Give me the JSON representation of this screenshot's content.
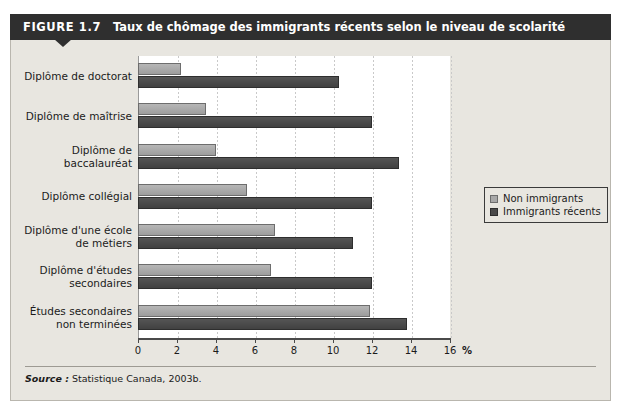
{
  "figure": {
    "number": "FIGURE 1.7",
    "title": "Taux de chômage des immigrants récents selon le niveau de scolarité",
    "source_label": "Source :",
    "source_text": " Statistique Canada, 2003b."
  },
  "legend": {
    "items": [
      {
        "label": "Non immigrants",
        "color": "#a8a8a8"
      },
      {
        "label": "Immigrants récents",
        "color": "#4a4a4a"
      }
    ]
  },
  "axis": {
    "unit": "%",
    "ticks": [
      "0",
      "2",
      "4",
      "6",
      "8",
      "10",
      "12",
      "14",
      "16"
    ]
  },
  "chart_data": {
    "type": "bar",
    "orientation": "horizontal",
    "title": "Taux de chômage des immigrants récents selon le niveau de scolarité",
    "xlabel": "%",
    "ylabel": "",
    "xlim": [
      0,
      16
    ],
    "xticks": [
      0,
      2,
      4,
      6,
      8,
      10,
      12,
      14,
      16
    ],
    "grid": true,
    "legend_position": "right",
    "categories": [
      "Diplôme de doctorat",
      "Diplôme de maîtrise",
      "Diplôme de\nbaccalauréat",
      "Diplôme collégial",
      "Diplôme d'une école\nde métiers",
      "Diplôme d'études\nsecondaires",
      "Études secondaires\nnon terminées"
    ],
    "series": [
      {
        "name": "Non immigrants",
        "color": "#a8a8a8",
        "values": [
          2.2,
          3.5,
          4.0,
          5.6,
          7.0,
          6.8,
          11.9
        ]
      },
      {
        "name": "Immigrants récents",
        "color": "#4a4a4a",
        "values": [
          10.3,
          12.0,
          13.4,
          12.0,
          11.0,
          12.0,
          13.8
        ]
      }
    ]
  }
}
